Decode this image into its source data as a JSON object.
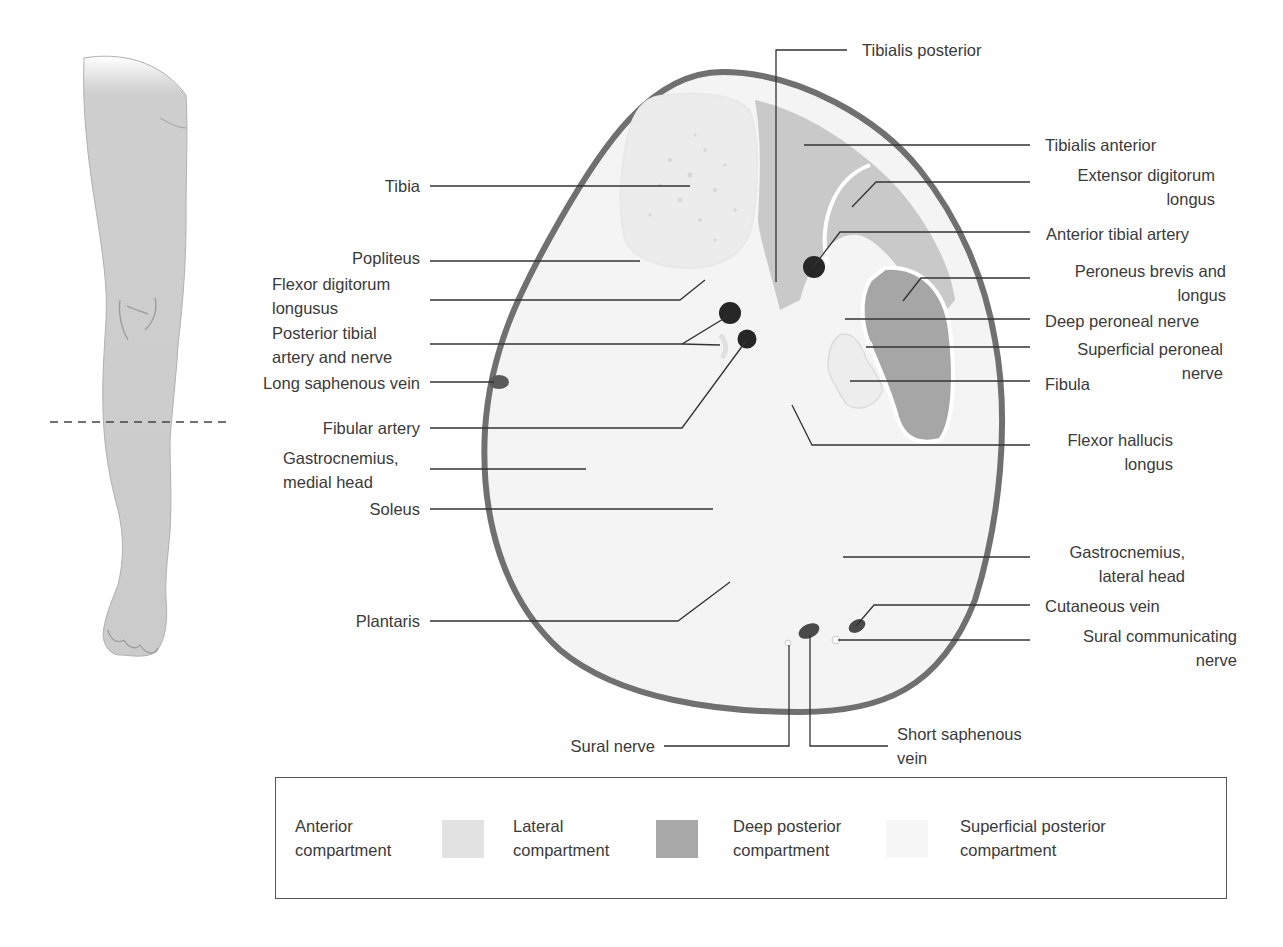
{
  "diagram": {
    "type": "anatomical cross-section",
    "section_line": "dashed line across the calf of the leg illustration"
  },
  "labels_left": [
    {
      "id": "tibia",
      "text": [
        "Tibia"
      ]
    },
    {
      "id": "popliteus",
      "text": [
        "Popliteus"
      ]
    },
    {
      "id": "flexor-digitorum-longusus",
      "text": [
        "Flexor digitorum",
        "longusus"
      ]
    },
    {
      "id": "posterior-tibial-artery-nerve",
      "text": [
        "Posterior tibial",
        "artery and nerve"
      ]
    },
    {
      "id": "long-saphenous-vein",
      "text": [
        "Long saphenous vein"
      ]
    },
    {
      "id": "fibular-artery",
      "text": [
        "Fibular artery"
      ]
    },
    {
      "id": "gastrocnemius-medial",
      "text": [
        "Gastrocnemius,",
        "medial head"
      ]
    },
    {
      "id": "soleus",
      "text": [
        "Soleus"
      ]
    },
    {
      "id": "plantaris",
      "text": [
        "Plantaris"
      ]
    }
  ],
  "labels_right": [
    {
      "id": "tibialis-posterior",
      "text": [
        "Tibialis posterior"
      ]
    },
    {
      "id": "tibialis-anterior",
      "text": [
        "Tibialis anterior"
      ]
    },
    {
      "id": "extensor-digitorum-longus",
      "text": [
        "Extensor digitorum",
        "longus"
      ]
    },
    {
      "id": "anterior-tibial-artery",
      "text": [
        "Anterior tibial artery"
      ]
    },
    {
      "id": "peroneus-brevis-longus",
      "text": [
        "Peroneus brevis and",
        "longus"
      ]
    },
    {
      "id": "deep-peroneal-nerve",
      "text": [
        "Deep peroneal nerve"
      ]
    },
    {
      "id": "superficial-peroneal-nerve",
      "text": [
        "Superficial peroneal",
        "nerve"
      ]
    },
    {
      "id": "fibula",
      "text": [
        "Fibula"
      ]
    },
    {
      "id": "flexor-hallucis-longus",
      "text": [
        "Flexor hallucis",
        "longus"
      ]
    },
    {
      "id": "gastrocnemius-lateral",
      "text": [
        "Gastrocnemius,",
        "lateral head"
      ]
    },
    {
      "id": "cutaneous-vein",
      "text": [
        "Cutaneous vein"
      ]
    },
    {
      "id": "sural-communicating-nerve",
      "text": [
        "Sural communicating",
        "nerve"
      ]
    }
  ],
  "labels_bottom": [
    {
      "id": "sural-nerve",
      "text": [
        "Sural nerve"
      ]
    },
    {
      "id": "short-saphenous-vein",
      "text": [
        "Short saphenous",
        "vein"
      ]
    }
  ],
  "legend": {
    "items": [
      {
        "label": [
          "Anterior",
          "compartment"
        ],
        "swatch_color": "#e2e2e2"
      },
      {
        "label": [
          "Lateral",
          "compartment"
        ],
        "swatch_color": "#a9a9a9"
      },
      {
        "label": [
          "Deep posterior",
          "compartment"
        ],
        "swatch_color": "#f7f7f7"
      },
      {
        "label": [
          "Superficial posterior",
          "compartment"
        ],
        "swatch_color": null
      }
    ]
  },
  "colors": {
    "outline": "#6e6e6e",
    "skin_fill": "#f3f3f3",
    "anterior_fill": "#c8c8c8",
    "lateral_fill": "#a8a8a8",
    "bone_fill": "#ececec",
    "vessel_fill": "#2a2a2a",
    "leader_line": "#333333",
    "leg_fill": "#cfcfcf"
  }
}
